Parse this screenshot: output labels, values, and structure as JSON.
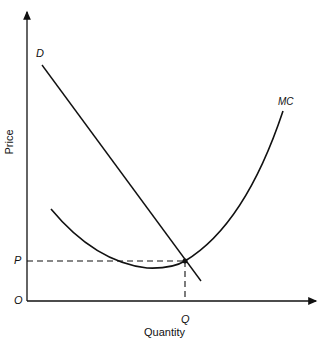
{
  "diagram": {
    "axes": {
      "x_label": "Quantity",
      "y_label": "Price",
      "origin_label": "O"
    },
    "curves": [
      {
        "name": "D",
        "label": "D",
        "description": "Downward-sloping demand curve"
      },
      {
        "name": "MC",
        "label": "MC",
        "description": "U-shaped marginal cost curve"
      }
    ],
    "equilibrium": {
      "price_label": "P",
      "quantity_label": "Q"
    },
    "colors": {
      "line": "#111111",
      "background": "#ffffff"
    }
  }
}
